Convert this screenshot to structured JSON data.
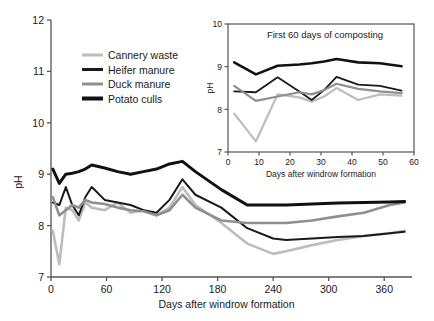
{
  "chart_data": [
    {
      "id": "main",
      "type": "line",
      "title": "",
      "xlabel": "Days after windrow formation",
      "ylabel": "pH",
      "xlim": [
        0,
        390
      ],
      "ylim": [
        7,
        12
      ],
      "xticks": [
        0,
        60,
        120,
        180,
        240,
        300,
        360
      ],
      "yticks": [
        7,
        8,
        9,
        10,
        11,
        12
      ],
      "grid": false,
      "legend_position": "top-left",
      "series": [
        {
          "name": "Cannery waste",
          "color": "#bdbdbd",
          "width": 2.6,
          "x": [
            2,
            9,
            16,
            23,
            30,
            37,
            44,
            58,
            72,
            86,
            100,
            114,
            128,
            142,
            156,
            184,
            212,
            240,
            254,
            282,
            310,
            338,
            366,
            382
          ],
          "y": [
            7.9,
            7.25,
            8.35,
            8.3,
            8.1,
            8.45,
            8.35,
            8.3,
            8.45,
            8.25,
            8.3,
            8.2,
            8.35,
            8.75,
            8.4,
            8.05,
            7.65,
            7.45,
            7.5,
            7.62,
            7.72,
            7.8,
            7.85,
            7.9
          ]
        },
        {
          "name": "Heifer manure",
          "color": "#1a1a1a",
          "width": 2.0,
          "x": [
            2,
            9,
            16,
            23,
            30,
            37,
            44,
            58,
            72,
            86,
            100,
            114,
            128,
            142,
            156,
            184,
            212,
            240,
            254,
            282,
            310,
            338,
            366,
            382
          ],
          "y": [
            8.45,
            8.4,
            8.75,
            8.4,
            8.2,
            8.55,
            8.75,
            8.5,
            8.45,
            8.4,
            8.3,
            8.25,
            8.5,
            8.9,
            8.6,
            8.35,
            7.95,
            7.75,
            7.72,
            7.75,
            7.78,
            7.8,
            7.85,
            7.88
          ]
        },
        {
          "name": "Duck manure",
          "color": "#8f8f8f",
          "width": 2.6,
          "x": [
            2,
            9,
            16,
            23,
            30,
            37,
            44,
            58,
            72,
            86,
            100,
            114,
            128,
            142,
            156,
            184,
            212,
            240,
            254,
            282,
            310,
            338,
            366,
            382
          ],
          "y": [
            8.55,
            8.2,
            8.3,
            8.4,
            8.35,
            8.5,
            8.45,
            8.42,
            8.35,
            8.3,
            8.28,
            8.2,
            8.3,
            8.6,
            8.35,
            8.1,
            8.05,
            8.05,
            8.05,
            8.1,
            8.18,
            8.25,
            8.4,
            8.45
          ]
        },
        {
          "name": "Potato culls",
          "color": "#111111",
          "width": 3.0,
          "x": [
            2,
            9,
            16,
            23,
            30,
            37,
            44,
            58,
            72,
            86,
            100,
            114,
            128,
            142,
            156,
            184,
            212,
            240,
            254,
            282,
            310,
            338,
            366,
            382
          ],
          "y": [
            9.1,
            8.82,
            9.0,
            9.02,
            9.05,
            9.1,
            9.18,
            9.12,
            9.05,
            9.0,
            9.05,
            9.1,
            9.2,
            9.25,
            9.05,
            8.7,
            8.4,
            8.4,
            8.4,
            8.42,
            8.44,
            8.45,
            8.46,
            8.47
          ]
        }
      ]
    },
    {
      "id": "inset",
      "type": "line",
      "title": "First 60 days of composting",
      "xlabel": "Days after windrow formation",
      "ylabel": "pH",
      "xlim": [
        0,
        60
      ],
      "ylim": [
        7,
        10
      ],
      "xticks": [
        0,
        10,
        20,
        30,
        40,
        50,
        60
      ],
      "yticks": [
        7,
        8,
        9,
        10
      ],
      "grid": false,
      "series": [
        {
          "name": "Cannery waste",
          "color": "#bdbdbd",
          "width": 2.2,
          "x": [
            2,
            9,
            16,
            23,
            27,
            31,
            35,
            42,
            49,
            56
          ],
          "y": [
            7.9,
            7.25,
            8.35,
            8.28,
            8.18,
            8.3,
            8.5,
            8.22,
            8.35,
            8.32
          ]
        },
        {
          "name": "Heifer manure",
          "color": "#1a1a1a",
          "width": 1.8,
          "x": [
            2,
            9,
            16,
            23,
            27,
            31,
            35,
            42,
            49,
            56
          ],
          "y": [
            8.42,
            8.4,
            8.75,
            8.42,
            8.22,
            8.45,
            8.76,
            8.58,
            8.55,
            8.44
          ]
        },
        {
          "name": "Duck manure",
          "color": "#8f8f8f",
          "width": 2.2,
          "x": [
            2,
            9,
            16,
            23,
            27,
            31,
            35,
            42,
            49,
            56
          ],
          "y": [
            8.55,
            8.2,
            8.3,
            8.4,
            8.35,
            8.45,
            8.6,
            8.48,
            8.42,
            8.38
          ]
        },
        {
          "name": "Potato culls",
          "color": "#111111",
          "width": 2.6,
          "x": [
            2,
            9,
            16,
            23,
            27,
            31,
            35,
            42,
            49,
            56
          ],
          "y": [
            9.1,
            8.82,
            9.02,
            9.05,
            9.08,
            9.12,
            9.18,
            9.1,
            9.08,
            9.01
          ]
        }
      ]
    }
  ],
  "main": {
    "ylabel": "pH",
    "xlabel": "Days after windrow formation",
    "yticks": [
      "12",
      "11",
      "10",
      "9",
      "8",
      "7"
    ],
    "xticks": [
      "0",
      "60",
      "120",
      "180",
      "240",
      "300",
      "360"
    ]
  },
  "inset": {
    "title": "First 60 days of composting",
    "ylabel": "pH",
    "xlabel": "Days after windrow formation",
    "yticks": [
      "10",
      "9",
      "8",
      "7"
    ],
    "xticks": [
      "0",
      "10",
      "20",
      "30",
      "40",
      "50",
      "60"
    ]
  },
  "legend": {
    "items": [
      {
        "label": "Cannery waste",
        "color": "#bdbdbd",
        "thickness": 3
      },
      {
        "label": "Heifer manure",
        "color": "#1a1a1a",
        "thickness": 3
      },
      {
        "label": "Duck manure",
        "color": "#8f8f8f",
        "thickness": 3
      },
      {
        "label": "Potato culls",
        "color": "#111111",
        "thickness": 4
      }
    ]
  }
}
